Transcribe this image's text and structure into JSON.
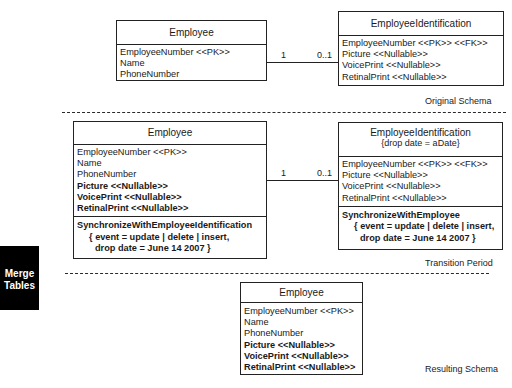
{
  "sections": {
    "original": {
      "label": "Original Schema",
      "employee": {
        "title": "Employee",
        "attributes": [
          "EmployeeNumber <<PK>>",
          "Name",
          "PhoneNumber"
        ]
      },
      "identification": {
        "title": "EmployeeIdentification",
        "attributes": [
          "EmployeeNumber <<PK>> <<FK>>",
          "Picture <<Nullable>>",
          "VoicePrint <<Nullable>>",
          "RetinalPrint <<Nullable>>"
        ]
      },
      "association": {
        "left_mult": "1",
        "right_mult": "0..1"
      }
    },
    "transition": {
      "label": "Transition Period",
      "employee": {
        "title": "Employee",
        "attributes": [
          "EmployeeNumber <<PK>>",
          "Name",
          "PhoneNumber"
        ],
        "new_attributes": [
          "Picture <<Nullable>>",
          "VoicePrint <<Nullable>>",
          "RetinalPrint <<Nullable>>"
        ],
        "operation": {
          "name": "SynchronizeWithEmployeeIdentification",
          "line1": "{ event = update | delete | insert,",
          "line2": "drop date = June 14 2007 }"
        }
      },
      "identification": {
        "title": "EmployeeIdentification",
        "subtitle": "{drop date = aDate}",
        "attributes": [
          "EmployeeNumber <<PK>> <<FK>>",
          "Picture <<Nullable>>",
          "VoicePrint <<Nullable>>",
          "RetinalPrint <<Nullable>>"
        ],
        "operation": {
          "name": "SynchronizeWithEmployee",
          "line1": "{ event = update | delete | insert,",
          "line2": "drop date = June 14 2007 }"
        }
      },
      "association": {
        "left_mult": "1",
        "right_mult": "0..1"
      }
    },
    "resulting": {
      "label": "Resulting Schema",
      "employee": {
        "title": "Employee",
        "attributes": [
          "EmployeeNumber <<PK>>",
          "Name",
          "PhoneNumber"
        ],
        "bold_attributes": [
          "Picture <<Nullable>>",
          "VoicePrint <<Nullable>>",
          "RetinalPrint <<Nullable>>"
        ]
      }
    }
  },
  "side_tag": {
    "line1": "Merge",
    "line2": "Tables",
    "background": "#000000",
    "color": "#ffffff"
  }
}
